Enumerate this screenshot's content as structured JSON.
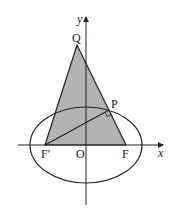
{
  "diagram": {
    "axes": {
      "x_label": "x",
      "y_label": "y",
      "origin_label": "O"
    },
    "points": {
      "Q": "Q",
      "P": "P",
      "F_prime": "F′",
      "F": "F"
    },
    "colors": {
      "fill": "#b3b3b3",
      "stroke": "#222222"
    }
  }
}
